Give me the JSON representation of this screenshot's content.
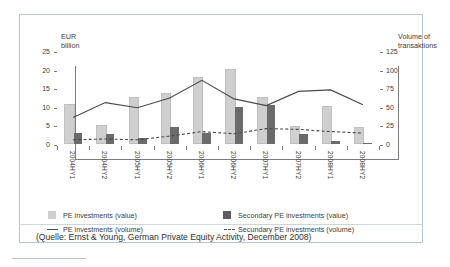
{
  "axes": {
    "left_title": "EUR\nbillion",
    "right_title": "Volume of\ntransaktions",
    "left_ticks": [
      "25",
      "20",
      "15",
      "10",
      "5",
      "0"
    ],
    "right_ticks": [
      "125",
      "100",
      "75",
      "50",
      "25",
      "0"
    ]
  },
  "legend": {
    "pe_value": "PE investments (value)",
    "pe_volume": "PE investments (volume)",
    "sec_value": "Secondary PE  investments (value)",
    "sec_volume": "Secundary PE investments (volume)"
  },
  "source": "(Quelle: Ernst & Young, German Private Equity Activity, December 2008)",
  "colors": {
    "pe_value_bar": "#cfcfcf",
    "sec_value_bar": "#6b6b6b",
    "line": "#4a4a4a",
    "axis": "#7c7c7c",
    "frame": "#b9c4cf"
  },
  "chart_data": {
    "type": "bar",
    "title": "",
    "subtitle": "",
    "xlabel": "",
    "ylabel": "EUR billion",
    "y2label": "Volume of transaktions",
    "ylim": [
      0,
      25
    ],
    "y2lim": [
      0,
      125
    ],
    "grid": false,
    "legend_position": "bottom",
    "categories": [
      "2004HY1",
      "2004HY2",
      "2005HY1",
      "2005HY2",
      "2006HY1",
      "2006HY2",
      "2007HY1",
      "2007HY2",
      "2008HY1",
      "2008HY2"
    ],
    "series": [
      {
        "name": "PE investments (value)",
        "type": "bar",
        "axis": "left",
        "unit": "EUR billion",
        "values": [
          10.2,
          4.5,
          12.1,
          13.1,
          17.4,
          19.7,
          12.1,
          4.3,
          9.6,
          4.1
        ]
      },
      {
        "name": "Secondary PE  investments (value)",
        "type": "bar",
        "axis": "left",
        "unit": "EUR billion",
        "values": [
          3.0,
          2.6,
          1.7,
          4.5,
          2.9,
          9.9,
          10.6,
          2.6,
          0.9,
          0.2
        ]
      },
      {
        "name": "PE investments (volume)",
        "type": "line",
        "axis": "right",
        "unit": "transactions",
        "values": [
          37,
          57,
          50,
          63,
          87,
          62,
          53,
          72,
          74,
          54
        ]
      },
      {
        "name": "Secundary PE investments (volume)",
        "type": "line",
        "axis": "right",
        "unit": "transactions",
        "dashed": true,
        "values": [
          7,
          8,
          7,
          12,
          18,
          15,
          22,
          21,
          18,
          16
        ]
      }
    ]
  }
}
